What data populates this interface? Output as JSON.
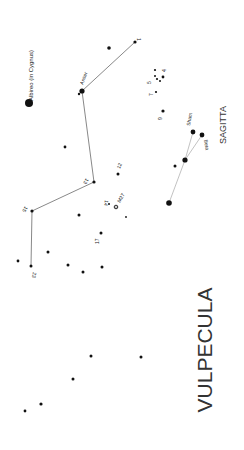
{
  "title": "VULPECULA",
  "neighbor": "SAGITTA",
  "colors": {
    "background": "#ffffff",
    "star": "#111111",
    "line": "#555555",
    "sagitta_line": "#bbbbbb",
    "text": "#222222"
  },
  "stars": [
    {
      "id": "albireo",
      "x": 29,
      "y": 103,
      "r": 4.0,
      "label": "Albireo (in Cygnus)",
      "lx": 33,
      "ly": 101,
      "rot": -90
    },
    {
      "id": "anser",
      "x": 82,
      "y": 91,
      "r": 2.6,
      "label": "Anser",
      "lx": 83,
      "ly": 85,
      "rot": -70
    },
    {
      "id": "s-anser-b",
      "x": 79,
      "y": 94,
      "r": 1.2
    },
    {
      "id": "s1",
      "x": 135,
      "y": 42,
      "r": 1.6,
      "label": "1",
      "lx": 137,
      "ly": 38,
      "rot": 90
    },
    {
      "id": "s-near1",
      "x": 109,
      "y": 48,
      "r": 1.8
    },
    {
      "id": "s4",
      "x": 163,
      "y": 77,
      "r": 1.4,
      "label": "4",
      "lx": 166,
      "ly": 72,
      "rot": -90
    },
    {
      "id": "s5",
      "x": 157,
      "y": 79,
      "r": 1.1,
      "label": "5",
      "lx": 151,
      "ly": 84,
      "rot": -90
    },
    {
      "id": "s5b",
      "x": 155,
      "y": 70,
      "r": 1.1
    },
    {
      "id": "s5c",
      "x": 155,
      "y": 76,
      "r": 1.0
    },
    {
      "id": "s5d",
      "x": 160,
      "y": 81,
      "r": 1.0
    },
    {
      "id": "s7",
      "x": 156,
      "y": 92,
      "r": 1.1,
      "label": "7",
      "lx": 153,
      "ly": 96,
      "rot": -90
    },
    {
      "id": "s9",
      "x": 163,
      "y": 111,
      "r": 1.6,
      "label": "9",
      "lx": 162,
      "ly": 120,
      "rot": -90
    },
    {
      "id": "sham",
      "x": 193,
      "y": 132,
      "r": 2.4,
      "label": "Sham",
      "lx": 190,
      "ly": 126,
      "rot": -80
    },
    {
      "id": "beta",
      "x": 202,
      "y": 135,
      "r": 2.4,
      "label": "Beta",
      "lx": 204,
      "ly": 140,
      "rot": 80
    },
    {
      "id": "delta",
      "x": 185,
      "y": 160,
      "r": 2.6
    },
    {
      "id": "s-delta-b",
      "x": 175,
      "y": 166,
      "r": 1.5
    },
    {
      "id": "gamma",
      "x": 169,
      "y": 203,
      "r": 2.8
    },
    {
      "id": "s-left1",
      "x": 65,
      "y": 147,
      "r": 1.4
    },
    {
      "id": "s13",
      "x": 94,
      "y": 182,
      "r": 1.6,
      "label": "13",
      "lx": 86,
      "ly": 178,
      "rot": 120
    },
    {
      "id": "s12",
      "x": 118,
      "y": 174,
      "r": 1.5,
      "label": "12",
      "lx": 120,
      "ly": 169,
      "rot": -70
    },
    {
      "id": "s14",
      "x": 109,
      "y": 204,
      "r": 1.0,
      "label": "14",
      "lx": 105,
      "ly": 200,
      "rot": 100
    },
    {
      "id": "m27",
      "x": 116,
      "y": 207,
      "r": 1.8,
      "label": "M27",
      "lx": 120,
      "ly": 203,
      "rot": -60,
      "cluster": true
    },
    {
      "id": "s-m27b",
      "x": 126,
      "y": 217,
      "r": 0.9
    },
    {
      "id": "s15",
      "x": 32,
      "y": 211,
      "r": 1.6,
      "label": "15",
      "lx": 25,
      "ly": 206,
      "rot": 120
    },
    {
      "id": "s-mid1",
      "x": 79,
      "y": 215,
      "r": 1.5
    },
    {
      "id": "s17",
      "x": 101,
      "y": 233,
      "r": 1.5,
      "label": "17",
      "lx": 99,
      "ly": 244,
      "rot": -90
    },
    {
      "id": "s-l23a",
      "x": 48,
      "y": 252,
      "r": 1.5
    },
    {
      "id": "s-l23b",
      "x": 18,
      "y": 261,
      "r": 1.4
    },
    {
      "id": "s23",
      "x": 31,
      "y": 266,
      "r": 1.5,
      "label": "23",
      "lx": 33,
      "ly": 272,
      "rot": 100
    },
    {
      "id": "s-l23c",
      "x": 68,
      "y": 265,
      "r": 1.5
    },
    {
      "id": "s-l23d",
      "x": 83,
      "y": 272,
      "r": 1.5
    },
    {
      "id": "s-l23e",
      "x": 102,
      "y": 267,
      "r": 1.5
    },
    {
      "id": "s-b1",
      "x": 91,
      "y": 356,
      "r": 1.5
    },
    {
      "id": "s-b2",
      "x": 141,
      "y": 357,
      "r": 1.5
    },
    {
      "id": "s-b3",
      "x": 73,
      "y": 379,
      "r": 1.5
    },
    {
      "id": "s-b4",
      "x": 41,
      "y": 404,
      "r": 1.6
    },
    {
      "id": "s-b5",
      "x": 25,
      "y": 411,
      "r": 1.4
    }
  ],
  "lines": [
    {
      "from": "anser",
      "to": "s1",
      "style": "main"
    },
    {
      "from": "anser",
      "to": "s13",
      "style": "main"
    },
    {
      "from": "s13",
      "to": "s15",
      "style": "main"
    },
    {
      "from": "s15",
      "to": "s23",
      "style": "main"
    },
    {
      "from": "sham",
      "to": "delta",
      "style": "sagitta"
    },
    {
      "from": "beta",
      "to": "delta",
      "style": "sagitta"
    },
    {
      "from": "delta",
      "to": "gamma",
      "style": "sagitta"
    }
  ],
  "labels": {
    "constellation": {
      "text": "VULPECULA",
      "x": 212,
      "y": 350,
      "rot": -90
    },
    "neighbor": {
      "text": "SAGITTA",
      "x": 226,
      "y": 125,
      "rot": -90
    }
  }
}
